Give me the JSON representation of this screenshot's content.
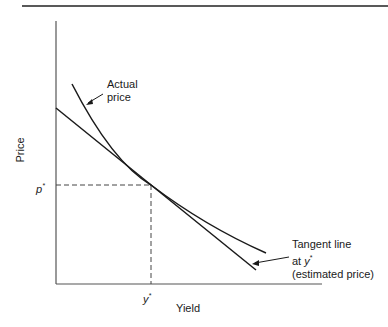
{
  "diagram": {
    "title_rule": true,
    "axes": {
      "x_label": "Yield",
      "y_label": "Price",
      "x_marker": "y",
      "x_marker_sup": "*",
      "y_marker": "p",
      "y_marker_sup": "*"
    },
    "annotations": {
      "actual_line1": "Actual",
      "actual_line2": "price",
      "tangent_line1": "Tangent line",
      "tangent_line2_prefix": "at ",
      "tangent_line2_var": "y",
      "tangent_line2_sup": "*",
      "tangent_line3": "(estimated price)"
    },
    "colors": {
      "line": "#1a1a1a",
      "axis": "#555555"
    }
  }
}
